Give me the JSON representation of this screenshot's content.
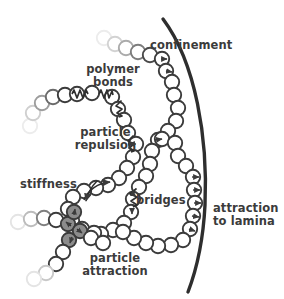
{
  "figure": {
    "type": "schematic-diagram",
    "background": "#ffffff",
    "ink_color": "#3b3b3b",
    "bead_fill": "#ffffff",
    "bead_stroke": "#3b3b3b",
    "attraction_bead_fill": "#8c8c8c",
    "lamina_color": "#2e2e2e"
  },
  "labels": {
    "confinement": "confinement",
    "polymer_bonds_line1": "polymer",
    "polymer_bonds_line2": "bonds",
    "particle_repulsion_line1": "particle",
    "particle_repulsion_line2": "repulsion",
    "stiffness": "stiffness",
    "bridges": "bridges",
    "attraction_to_lamina_line1": "attraction",
    "attraction_to_lamina_line2": "to lamina",
    "particle_attraction_line1": "particle",
    "particle_attraction_line2": "attraction"
  },
  "annotations": [
    {
      "name": "confinement",
      "text": "confinement",
      "x": 178,
      "y": 46,
      "depicts": "thick arc wall bounding the polymer"
    },
    {
      "name": "polymer-bonds",
      "text": "polymer bonds",
      "x": 113,
      "y": 70,
      "depicts": "zigzag spring connecting adjacent beads"
    },
    {
      "name": "particle-repulsion",
      "text": "particle repulsion",
      "x": 110,
      "y": 133,
      "depicts": "outward arrows between nearby beads"
    },
    {
      "name": "stiffness",
      "text": "stiffness",
      "x": 52,
      "y": 184,
      "depicts": "curved bending arrow across three beads"
    },
    {
      "name": "bridges",
      "text": "bridges",
      "x": 165,
      "y": 200,
      "depicts": "spring linking two non-adjacent beads"
    },
    {
      "name": "attraction-to-lamina",
      "text": "attraction to lamina",
      "x": 252,
      "y": 210,
      "depicts": "arrows pulling beads toward the wall"
    },
    {
      "name": "particle-attraction",
      "text": "particle attraction",
      "x": 113,
      "y": 260,
      "depicts": "gray filled beads drawn together"
    }
  ],
  "elements": {
    "lamina_arc": {
      "name": "lamina-arc",
      "stroke_width": 3.4
    },
    "bead_radius": 7.2,
    "chain_count": 4,
    "gray_bead_count": 4,
    "spring_count": 5
  }
}
